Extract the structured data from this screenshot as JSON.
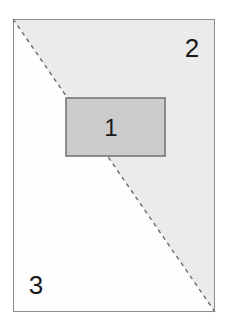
{
  "figure": {
    "canvas": {
      "width": 234,
      "height": 330,
      "background_color": "#ffffff"
    },
    "outer_rectangle": {
      "name": "outer-rectangle",
      "x": 13,
      "y": 19,
      "width": 202,
      "height": 293,
      "fill_color": "#fefefe",
      "stroke_color": "#8c8c8c",
      "stroke_width": 1
    },
    "diagonal": {
      "name": "diagonal-dashed-line",
      "x1": 13,
      "y1": 19,
      "x2": 215,
      "y2": 312,
      "stroke_color": "#6b6b6b",
      "stroke_width": 1.4,
      "dash_pattern": "4 4",
      "style": "dashed"
    },
    "regions": [
      {
        "id": "region-2",
        "label": "2",
        "description": "upper-right triangle above the diagonal",
        "fill_color": "#ebebeb",
        "label_x": 192,
        "label_y": 57
      },
      {
        "id": "region-3",
        "label": "3",
        "description": "lower-left triangle below the diagonal",
        "fill_color": "#fefefe",
        "label_x": 36,
        "label_y": 294
      }
    ],
    "inner_rectangle": {
      "name": "inner-rectangle",
      "label": "1",
      "description": "shaded rectangle straddling the diagonal",
      "x": 66,
      "y": 98,
      "width": 99,
      "height": 58,
      "fill_color": "#cccccc",
      "stroke_color": "#767676",
      "stroke_width": 1.6,
      "label_x": 111,
      "label_y": 136
    }
  }
}
